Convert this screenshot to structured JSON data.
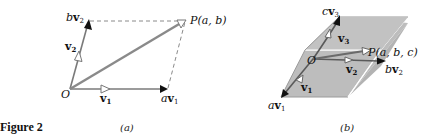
{
  "caption": {
    "figure_label": "Figure 2",
    "panel_a": "(a)",
    "panel_b": "(b)"
  },
  "panel_a": {
    "labels": {
      "origin": "O",
      "v1": "v",
      "v1_sub": "1",
      "av1_coef": "a",
      "av1_vec": "v",
      "av1_sub": "1",
      "v2": "v",
      "v2_sub": "2",
      "bv2_coef": "b",
      "bv2_vec": "v",
      "bv2_sub": "2",
      "point": "P(a, b)"
    }
  },
  "panel_b": {
    "labels": {
      "origin": "O",
      "v1": "v",
      "v1_sub": "1",
      "av1_coef": "a",
      "av1_vec": "v",
      "av1_sub": "1",
      "v2": "v",
      "v2_sub": "2",
      "bv2_coef": "b",
      "bv2_vec": "v",
      "bv2_sub": "2",
      "v3": "v",
      "v3_sub": "3",
      "cv3_coef": "c",
      "cv3_vec": "v",
      "cv3_sub": "3",
      "point": "P(a, b, c)"
    }
  },
  "colors": {
    "background": "#ffffff",
    "vector_gray": "#7a7a7a",
    "diagonal_gray": "#8a8a8a",
    "box_fill": "#bdbdbd",
    "box_edge": "#ffffff",
    "arrow_black": "#111111",
    "dashed": "#888888"
  }
}
